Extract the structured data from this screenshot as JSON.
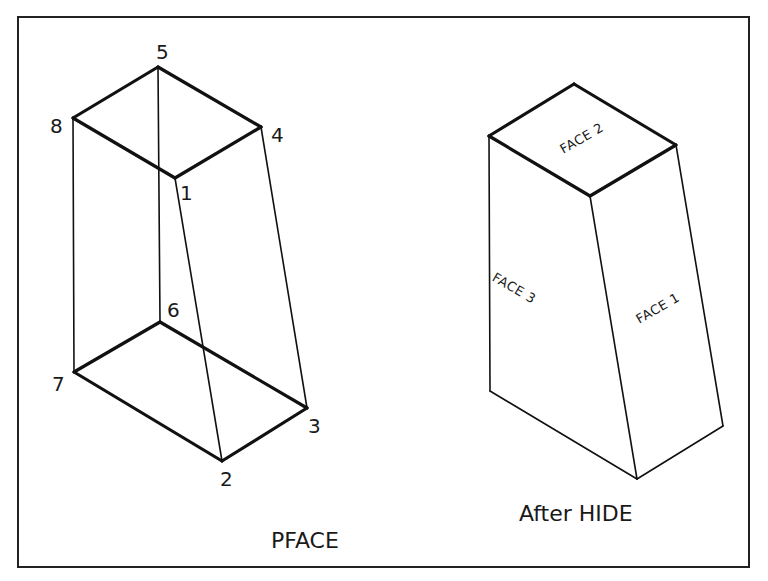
{
  "figure": {
    "frame": {
      "x1": 18,
      "y1": 17,
      "x2": 749,
      "y2": 567
    },
    "left_view": {
      "caption": "PFACE",
      "caption_pos": [
        271,
        548
      ],
      "vertices": [
        {
          "id": "1",
          "label": "1",
          "x": 175,
          "y": 178,
          "lx": 180,
          "ly": 200
        },
        {
          "id": "2",
          "label": "2",
          "x": 222,
          "y": 461,
          "lx": 220,
          "ly": 486
        },
        {
          "id": "3",
          "label": "3",
          "x": 307,
          "y": 408,
          "lx": 308,
          "ly": 433
        },
        {
          "id": "4",
          "label": "4",
          "x": 261,
          "y": 127,
          "lx": 271,
          "ly": 142
        },
        {
          "id": "5",
          "label": "5",
          "x": 158,
          "y": 67,
          "lx": 156,
          "ly": 59
        },
        {
          "id": "6",
          "label": "6",
          "x": 160,
          "y": 322,
          "lx": 167,
          "ly": 317
        },
        {
          "id": "7",
          "label": "7",
          "x": 74,
          "y": 372,
          "lx": 52,
          "ly": 391
        },
        {
          "id": "8",
          "label": "8",
          "x": 73,
          "y": 118,
          "lx": 50,
          "ly": 133
        }
      ],
      "thick_edges": [
        [
          "5",
          "8"
        ],
        [
          "5",
          "4"
        ],
        [
          "8",
          "1"
        ],
        [
          "4",
          "1"
        ],
        [
          "6",
          "7"
        ],
        [
          "6",
          "3"
        ],
        [
          "7",
          "2"
        ],
        [
          "2",
          "3"
        ]
      ],
      "thin_edges": [
        [
          "5",
          "6"
        ],
        [
          "8",
          "7"
        ],
        [
          "4",
          "3"
        ],
        [
          "1",
          "2"
        ]
      ]
    },
    "right_view": {
      "caption": "After HIDE",
      "caption_pos": [
        519,
        521
      ],
      "points": {
        "top_back": [
          574,
          84
        ],
        "top_left": [
          489,
          136
        ],
        "top_right": [
          676,
          145
        ],
        "top_front": [
          590,
          196
        ],
        "bottom_left": [
          490,
          391
        ],
        "bottom_front": [
          637,
          479
        ],
        "bottom_right": [
          723,
          426
        ]
      },
      "thick_edges": [
        [
          "top_back",
          "top_left"
        ],
        [
          "top_back",
          "top_right"
        ],
        [
          "top_left",
          "top_front"
        ],
        [
          "top_right",
          "top_front"
        ]
      ],
      "thin_edges": [
        [
          "top_left",
          "bottom_left"
        ],
        [
          "top_front",
          "bottom_front"
        ],
        [
          "top_right",
          "bottom_right"
        ],
        [
          "bottom_left",
          "bottom_front"
        ],
        [
          "bottom_front",
          "bottom_right"
        ]
      ],
      "face_labels": [
        {
          "text": "FACE 2",
          "x": 584,
          "y": 142,
          "rotate": -30
        },
        {
          "text": "FACE 3",
          "x": 512,
          "y": 292,
          "rotate": 30
        },
        {
          "text": "FACE 1",
          "x": 660,
          "y": 312,
          "rotate": -30
        }
      ]
    }
  }
}
